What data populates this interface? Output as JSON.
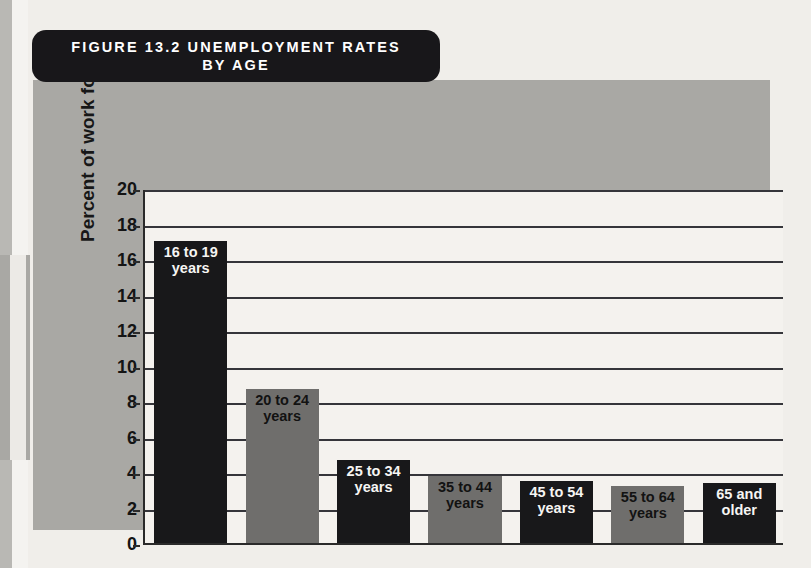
{
  "figure": {
    "title_line1": "FIGURE 13.2   UNEMPLOYMENT RATES",
    "title_line2": "BY AGE",
    "source": "Source: U.S. Bureau of Labor Statistics, 2005 data"
  },
  "colors": {
    "banner_bg": "#18171a",
    "panel_bg": "#a9a8a4",
    "plot_bg": "#f4f2ee",
    "bar_dark": "#18181a",
    "bar_light": "#6f6e6c",
    "gridline": "#35353a"
  },
  "chart_data": {
    "type": "bar",
    "title": "FIGURE 13.2   UNEMPLOYMENT RATES BY AGE",
    "xlabel": "",
    "ylabel": "Percent of work force",
    "ylim": [
      0,
      20
    ],
    "yticks": [
      0,
      2,
      4,
      6,
      8,
      10,
      12,
      14,
      16,
      18,
      20
    ],
    "grid": true,
    "legend": "none",
    "categories": [
      "16 to 19 years",
      "20 to 24 years",
      "25 to 34 years",
      "35 to 44 years",
      "45 to 54 years",
      "55 to 64 years",
      "65 and older"
    ],
    "values": [
      17.0,
      8.7,
      4.7,
      3.8,
      3.5,
      3.2,
      3.4
    ],
    "bar_colors": [
      "dark",
      "light",
      "dark",
      "light",
      "dark",
      "light",
      "dark"
    ],
    "bar_label_lines": [
      "16 to 19\nyears",
      "20 to 24\nyears",
      "25 to 34\nyears",
      "35 to 44\nyears",
      "45 to 54\nyears",
      "55 to 64\nyears",
      "65 and\nolder"
    ],
    "source": "Source: U.S. Bureau of Labor Statistics, 2005 data"
  }
}
